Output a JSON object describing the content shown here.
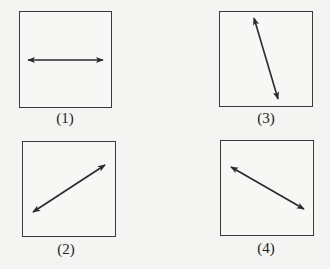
{
  "figure": {
    "panels": [
      {
        "id": "1",
        "label": "(1)",
        "direction": "horizontal",
        "box": [
          19,
          11,
          93,
          97
        ],
        "arrow": [
          28,
          60,
          103,
          60
        ]
      },
      {
        "id": "2",
        "label": "(2)",
        "direction": "diagonal-up-right",
        "box": [
          22,
          141,
          94,
          96
        ],
        "arrow": [
          33,
          212,
          105,
          165
        ]
      },
      {
        "id": "3",
        "label": "(3)",
        "direction": "steep-down-right",
        "box": [
          219,
          11,
          94,
          96
        ],
        "arrow": [
          254,
          18,
          278,
          99
        ]
      },
      {
        "id": "4",
        "label": "(4)",
        "direction": "diagonal-down-right",
        "box": [
          220,
          140,
          94,
          96
        ],
        "arrow": [
          231,
          167,
          304,
          209
        ]
      }
    ],
    "line_color": "#2a2a2a"
  }
}
